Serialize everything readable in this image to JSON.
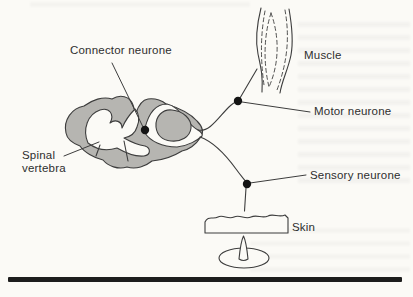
{
  "colors": {
    "paper": "#fbfaf6",
    "ink": "#3d3d3d",
    "gray": "#b6b5b1",
    "text": "#2e2e2e",
    "rule": "#1d1d1d"
  },
  "figure": {
    "type": "textbook-diagram",
    "labels": {
      "connector_neurone": "Connector neurone",
      "muscle": "Muscle",
      "motor_neurone": "Motor neurone",
      "spinal_vertebra": "Spinal vertebra",
      "sensory_neurone": "Sensory neurone",
      "skin": "Skin"
    },
    "parts": {
      "spinal_cord": "spinal-cord-cross-section-drawing",
      "connector_dot": "connector-neurone-synapse-dot",
      "motor_dot": "motor-neurone-junction-dot",
      "sensory_dot": "sensory-neurone-junction-dot",
      "muscle": "muscle-spindle-drawing",
      "skin": "skin-section-drawing",
      "pin": "pin-pricking-skin-drawing",
      "rule": "bottom-page-rule"
    }
  }
}
